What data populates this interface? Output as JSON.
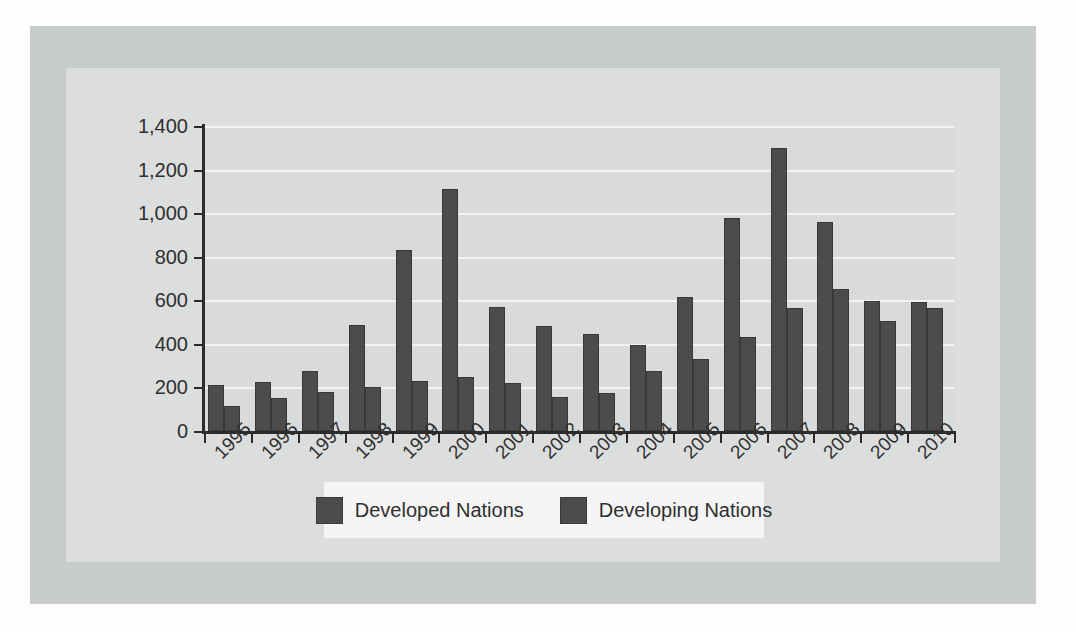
{
  "chart_data": {
    "type": "bar",
    "title": "",
    "xlabel": "",
    "ylabel": "",
    "ylim": [
      0,
      1400
    ],
    "ytick_step": 200,
    "grid": true,
    "legend_position": "bottom",
    "categories": [
      "1995",
      "1996",
      "1997",
      "1998",
      "1999",
      "2000",
      "2001",
      "2002",
      "2003",
      "2004",
      "2005",
      "2006",
      "2007",
      "2008",
      "2009",
      "2010"
    ],
    "ytick_labels": [
      "0",
      "200",
      "400",
      "600",
      "800",
      "1,000",
      "1,200",
      "1,400"
    ],
    "ytick_values": [
      0,
      200,
      400,
      600,
      800,
      1000,
      1200,
      1400
    ],
    "series": [
      {
        "name": "Developed Nations",
        "color": "#4c4c4c",
        "values": [
          210,
          225,
          275,
          485,
          830,
          1110,
          570,
          480,
          445,
          395,
          615,
          980,
          1300,
          960,
          595,
          590
        ]
      },
      {
        "name": "Developing Nations",
        "color": "#4c4c4c",
        "values": [
          115,
          150,
          180,
          200,
          230,
          250,
          220,
          155,
          175,
          275,
          330,
          430,
          565,
          650,
          505,
          565
        ]
      }
    ]
  },
  "colors": {
    "bar": "#4c4c4c",
    "bar_border": "#383838",
    "plot_background": "#d9dbda",
    "gridline": "#f2f3f2",
    "axis": "#2b2b2b",
    "outer_panel": "#c8cbcb",
    "inner_panel": "#dcdedd",
    "legend_background": "#f4f5f4",
    "text": "#2f2f2f"
  }
}
